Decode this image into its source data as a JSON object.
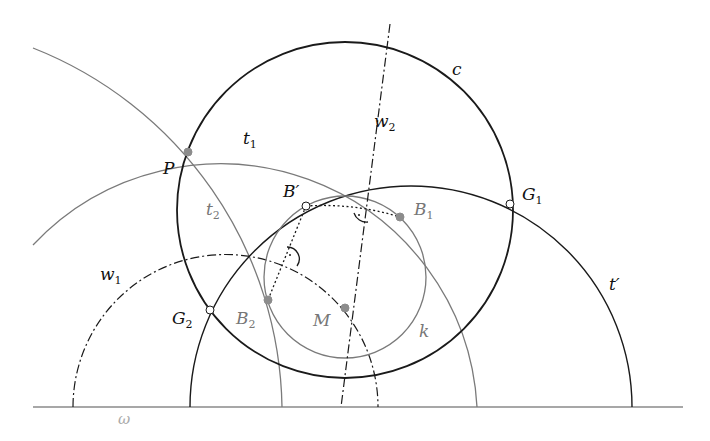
{
  "diagram": {
    "type": "geometric construction",
    "colors": {
      "black": "#1a1a1a",
      "gray": "#7a7a7a",
      "point_fill_gray": "#8c8c8c",
      "point_fill_open": "#ffffff"
    },
    "baseline": {
      "label": "ω",
      "x1": 33,
      "x2": 683,
      "y": 407
    },
    "circles": {
      "c": {
        "label": "c",
        "cx": 345,
        "cy": 210,
        "r": 168,
        "style": "thick-black"
      },
      "k": {
        "label": "k",
        "cx": 345,
        "cy": 277,
        "r": 81,
        "style": "gray"
      },
      "t_prime": {
        "label": "t′",
        "cx": 411,
        "cy": 407,
        "r": 221,
        "style": "black-semicircle"
      },
      "t1": {
        "label": "t",
        "sub": "1",
        "cx": 220,
        "cy": 407,
        "r": 257,
        "style": "gray-arc"
      },
      "t2": {
        "label": "t",
        "sub": "2",
        "cx": -111,
        "cy": 407,
        "r": 393,
        "style": "gray-arc"
      },
      "w1": {
        "label": "w",
        "sub": "1",
        "cx": 225.5,
        "cy": 407,
        "r": 152.5,
        "style": "dash-dot"
      }
    },
    "lines": {
      "w2": {
        "label": "w",
        "sub": "2",
        "x1": 390,
        "y1": 24,
        "x2": 341,
        "y2": 407,
        "style": "dash-dot"
      }
    },
    "points": {
      "P": {
        "label": "P",
        "x": 188,
        "y": 152,
        "fill": "gray"
      },
      "B_prime": {
        "label": "B′",
        "x": 306,
        "y": 206,
        "fill": "open"
      },
      "B1": {
        "label": "B",
        "sub": "1",
        "x": 400,
        "y": 217,
        "fill": "gray"
      },
      "B2": {
        "label": "B",
        "sub": "2",
        "x": 268,
        "y": 300,
        "fill": "gray"
      },
      "M": {
        "label": "M",
        "x": 345,
        "y": 308,
        "fill": "gray"
      },
      "G1": {
        "label": "G",
        "sub": "1",
        "x": 510,
        "y": 204,
        "fill": "open"
      },
      "G2": {
        "label": "G",
        "sub": "2",
        "x": 210,
        "y": 310,
        "fill": "open"
      }
    }
  }
}
